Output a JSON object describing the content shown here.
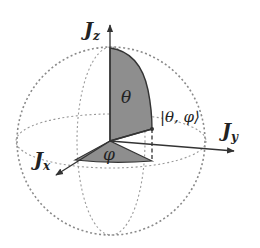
{
  "diagram": {
    "colors": {
      "background": "#ffffff",
      "shade": "#8e8e8e",
      "line": "#333333",
      "dashed": "#8a8a8a"
    },
    "axes": {
      "z": {
        "base": "J",
        "sub": "z"
      },
      "x": {
        "base": "J",
        "sub": "x"
      },
      "y": {
        "base": "J",
        "sub": "y"
      }
    },
    "angles": {
      "theta": "θ",
      "phi": "φ"
    },
    "state_label": "|θ, φ⟩"
  }
}
